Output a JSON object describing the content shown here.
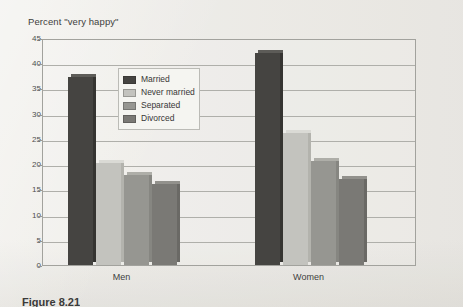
{
  "figure": {
    "caption": "Figure 8.21",
    "axis_title": "Percent \"very happy\""
  },
  "chart_data": {
    "type": "bar",
    "title": "",
    "xlabel": "",
    "ylabel": "Percent \"very happy\"",
    "ylim": [
      0,
      45
    ],
    "yticks": [
      0,
      5,
      10,
      15,
      20,
      25,
      30,
      35,
      40,
      45
    ],
    "grid": true,
    "legend_position": "inside-top-center",
    "categories": [
      "Men",
      "Women"
    ],
    "series": [
      {
        "name": "Married",
        "values": [
          37.3,
          42.0
        ],
        "color": "#33322f"
      },
      {
        "name": "Never married",
        "values": [
          20.3,
          26.2
        ],
        "color": "#bfbfba"
      },
      {
        "name": "Separated",
        "values": [
          17.8,
          20.6
        ],
        "color": "#8d8d88"
      },
      {
        "name": "Divorced",
        "values": [
          16.0,
          17.0
        ],
        "color": "#6e6d69"
      }
    ]
  },
  "legend": {
    "items": [
      {
        "label": "Married"
      },
      {
        "label": "Never married"
      },
      {
        "label": "Separated"
      },
      {
        "label": "Divorced"
      }
    ]
  }
}
